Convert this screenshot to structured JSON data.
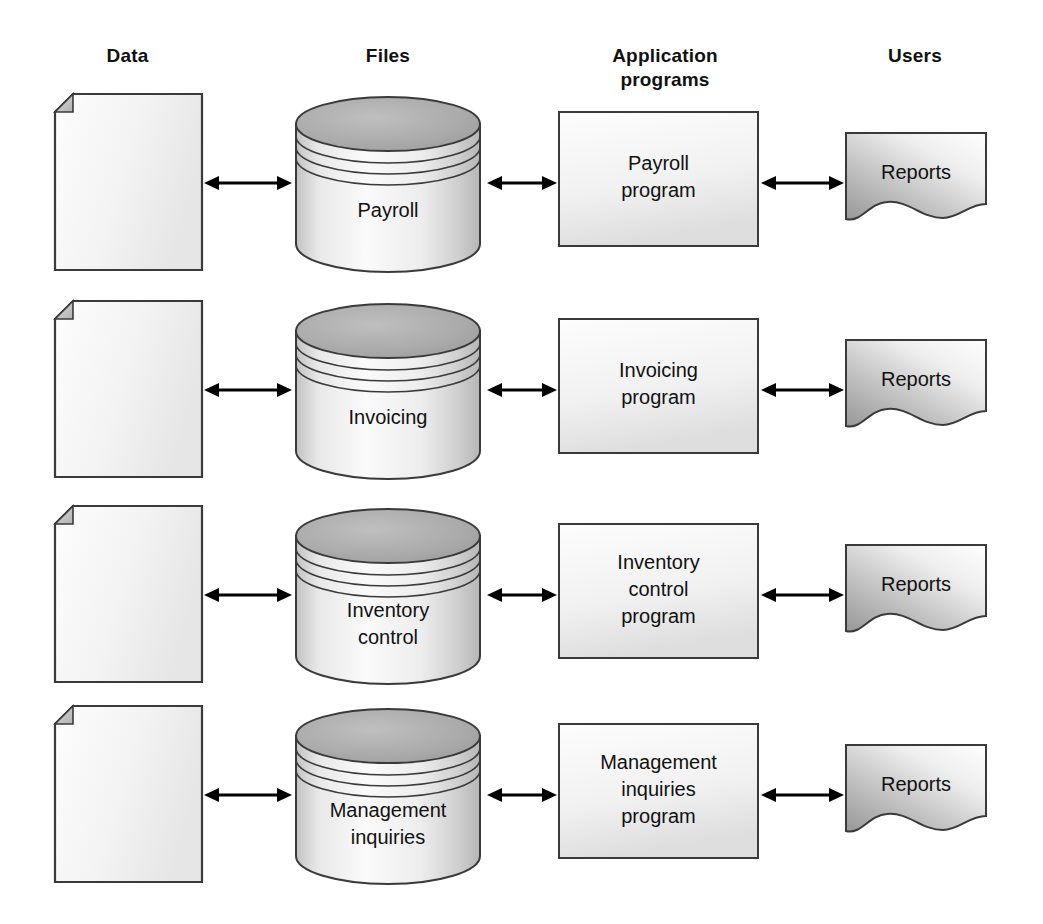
{
  "page": {
    "background_color": "#ffffff",
    "ink_color": "#111111"
  },
  "columns": [
    {
      "id": "data",
      "label": "Data",
      "icon": "document-icon"
    },
    {
      "id": "files",
      "label": "Files",
      "icon": "database-cylinder-icon"
    },
    {
      "id": "programs",
      "label": "Application\nprograms",
      "icon": "process-box-icon"
    },
    {
      "id": "users",
      "label": "Users",
      "icon": "report-document-icon"
    }
  ],
  "arrows": {
    "style": "double-headed",
    "label_data_to_file": "",
    "label_file_to_program": "",
    "label_program_to_user": ""
  },
  "rows": [
    {
      "id": "payroll",
      "data_label": "",
      "file_label": "Payroll",
      "program_label": "Payroll\nprogram",
      "user_label": "Reports"
    },
    {
      "id": "invoicing",
      "data_label": "",
      "file_label": "Invoicing",
      "program_label": "Invoicing\nprogram",
      "user_label": "Reports"
    },
    {
      "id": "inventory-control",
      "data_label": "",
      "file_label": "Inventory\ncontrol",
      "program_label": "Inventory\ncontrol\nprogram",
      "user_label": "Reports"
    },
    {
      "id": "management-inquiries",
      "data_label": "",
      "file_label": "Management\ninquiries",
      "program_label": "Management\ninquiries\nprogram",
      "user_label": "Reports"
    }
  ],
  "colors": {
    "outline": "#3a3a3a",
    "paper_fill_light": "#fbfbfb",
    "paper_fill_dark": "#e4e4e4",
    "cylinder_top": "#a9a9a9",
    "cylinder_body_light": "#f2f2f2",
    "cylinder_body_dark": "#bdbdbd",
    "report_light": "#fcfcfc",
    "report_dark": "#9b9b9b",
    "fold_fill": "#c9c9c9"
  }
}
